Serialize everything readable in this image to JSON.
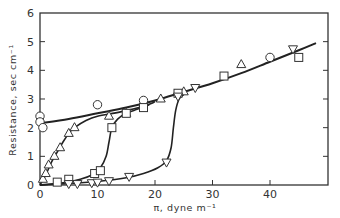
{
  "chart_data": {
    "type": "scatter",
    "title": "",
    "xlabel": "π, dyne m⁻¹",
    "ylabel": "Resistance, sec cm⁻¹",
    "xlim": [
      0,
      50
    ],
    "ylim": [
      0,
      6
    ],
    "xticks": [
      0,
      10,
      20,
      30,
      40
    ],
    "yticks": [
      0,
      1,
      2,
      3,
      4,
      5,
      6
    ],
    "grid": false,
    "legend": "none",
    "series": [
      {
        "name": "circles",
        "marker": "circle",
        "points": [
          [
            0,
            2.4
          ],
          [
            0,
            2.2
          ],
          [
            0.5,
            2.0
          ],
          [
            10,
            2.8
          ],
          [
            18,
            2.95
          ],
          [
            40,
            4.45
          ]
        ]
      },
      {
        "name": "triangles-up",
        "marker": "triangle-up",
        "points": [
          [
            0.5,
            0.2
          ],
          [
            1,
            0.4
          ],
          [
            1.5,
            0.7
          ],
          [
            2.5,
            1.0
          ],
          [
            3.5,
            1.3
          ],
          [
            5,
            1.8
          ],
          [
            6,
            2.0
          ],
          [
            12,
            2.4
          ],
          [
            15,
            2.5
          ],
          [
            21,
            3.0
          ],
          [
            25,
            3.25
          ],
          [
            35,
            4.2
          ]
        ]
      },
      {
        "name": "squares",
        "marker": "square",
        "points": [
          [
            3,
            0.1
          ],
          [
            5,
            0.2
          ],
          [
            9.5,
            0.4
          ],
          [
            10.5,
            0.5
          ],
          [
            12.5,
            2.0
          ],
          [
            15,
            2.5
          ],
          [
            18,
            2.7
          ],
          [
            24,
            3.2
          ],
          [
            32,
            3.8
          ],
          [
            45,
            4.45
          ]
        ]
      },
      {
        "name": "triangles-down",
        "marker": "triangle-down",
        "points": [
          [
            5,
            0.05
          ],
          [
            6.5,
            0.05
          ],
          [
            9,
            0.08
          ],
          [
            10,
            0.1
          ],
          [
            12,
            0.15
          ],
          [
            15.5,
            0.3
          ],
          [
            22,
            0.8
          ],
          [
            24,
            3.1
          ],
          [
            27,
            3.4
          ],
          [
            44,
            4.75
          ]
        ]
      }
    ],
    "curves": [
      {
        "name": "upper-linear-curve",
        "points": [
          [
            0,
            2.15
          ],
          [
            5,
            2.3
          ],
          [
            10,
            2.5
          ],
          [
            15,
            2.7
          ],
          [
            20,
            2.95
          ],
          [
            25,
            3.25
          ],
          [
            30,
            3.55
          ],
          [
            35,
            3.9
          ],
          [
            40,
            4.3
          ],
          [
            45,
            4.7
          ],
          [
            48,
            4.95
          ]
        ]
      },
      {
        "name": "triangle-up-curve",
        "points": [
          [
            0,
            0
          ],
          [
            1,
            0.35
          ],
          [
            2,
            0.8
          ],
          [
            3,
            1.15
          ],
          [
            4,
            1.5
          ],
          [
            5,
            1.8
          ],
          [
            6,
            2.0
          ],
          [
            8,
            2.25
          ],
          [
            10,
            2.4
          ],
          [
            14,
            2.55
          ],
          [
            18,
            2.75
          ],
          [
            20,
            2.9
          ]
        ]
      },
      {
        "name": "square-curve",
        "points": [
          [
            0,
            0
          ],
          [
            4,
            0.08
          ],
          [
            7,
            0.2
          ],
          [
            9,
            0.35
          ],
          [
            10.5,
            0.6
          ],
          [
            11.5,
            1.0
          ],
          [
            12,
            1.5
          ],
          [
            12.5,
            2.0
          ],
          [
            13.5,
            2.3
          ],
          [
            15,
            2.5
          ],
          [
            17,
            2.65
          ],
          [
            19,
            2.8
          ]
        ]
      },
      {
        "name": "triangle-down-curve",
        "points": [
          [
            0,
            0
          ],
          [
            5,
            0.05
          ],
          [
            10,
            0.12
          ],
          [
            15,
            0.25
          ],
          [
            18,
            0.4
          ],
          [
            20.5,
            0.6
          ],
          [
            22,
            0.85
          ],
          [
            22.8,
            1.3
          ],
          [
            23.2,
            2.0
          ],
          [
            23.6,
            2.6
          ],
          [
            24.2,
            3.0
          ],
          [
            25,
            3.15
          ]
        ]
      }
    ]
  },
  "axes": {
    "y_tick_labels": [
      "0",
      "1",
      "2",
      "3",
      "4",
      "5",
      "6"
    ],
    "x_tick_labels": [
      "0",
      "10",
      "20",
      "30",
      "40"
    ],
    "x_label": "π,  dyne  m⁻¹",
    "y_label": "Resistance,  sec  cm⁻¹"
  }
}
